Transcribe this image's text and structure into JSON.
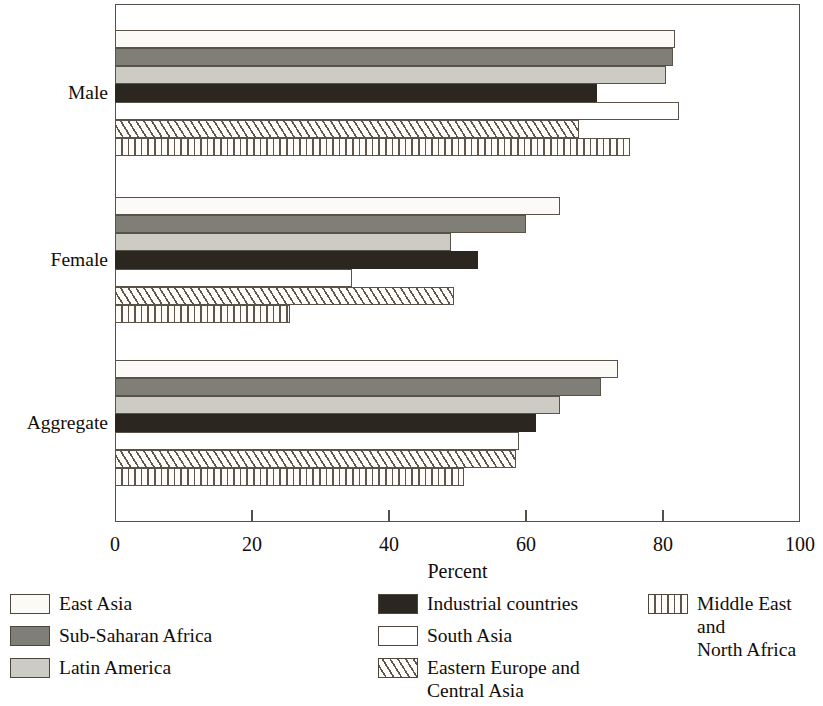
{
  "chart_data": {
    "type": "bar",
    "orientation": "horizontal",
    "title": "",
    "xlabel": "Percent",
    "ylabel": "",
    "xlim": [
      0,
      100
    ],
    "xticks": [
      0,
      20,
      40,
      60,
      80,
      100
    ],
    "xtick_labels": [
      "0",
      "20",
      "40",
      "60",
      "80",
      "100"
    ],
    "grid": false,
    "legend_position": "below",
    "categories": [
      "Male",
      "Female",
      "Aggregate"
    ],
    "series": [
      {
        "name": "East Asia",
        "values": [
          81.8,
          65.0,
          73.5
        ],
        "color": "#fbfaf6",
        "pattern": "solid"
      },
      {
        "name": "Sub-Saharan Africa",
        "values": [
          81.5,
          60.0,
          71.0
        ],
        "color": "#7f7f78",
        "pattern": "solid"
      },
      {
        "name": "Latin America",
        "values": [
          80.5,
          49.0,
          65.0
        ],
        "color": "#ccccc4",
        "pattern": "solid"
      },
      {
        "name": "Industrial countries",
        "values": [
          70.3,
          53.0,
          61.5
        ],
        "color": "#2c2620",
        "pattern": "solid"
      },
      {
        "name": "South Asia",
        "values": [
          82.3,
          34.6,
          59.0
        ],
        "color": "#ffffff",
        "pattern": "solid"
      },
      {
        "name": "Eastern Europe and Central Asia",
        "values": [
          67.8,
          49.5,
          58.5
        ],
        "color": "#fdfcf8",
        "pattern": "diagonal-hatch"
      },
      {
        "name": "Middle East and North Africa",
        "values": [
          75.2,
          25.5,
          51.0
        ],
        "color": "#fdfcf8",
        "pattern": "vertical-hatch"
      }
    ]
  },
  "axis": {
    "title": "Percent",
    "tick_labels": [
      "0",
      "20",
      "40",
      "60",
      "80",
      "100"
    ]
  },
  "group_labels": [
    "Male",
    "Female",
    "Aggregate"
  ],
  "legend": {
    "columns": [
      [
        {
          "label": "East Asia",
          "swatch": "east-asia"
        },
        {
          "label": "Sub-Saharan Africa",
          "swatch": "sub-saharan"
        },
        {
          "label": "Latin America",
          "swatch": "latin-america"
        }
      ],
      [
        {
          "label": "Industrial countries",
          "swatch": "industrial"
        },
        {
          "label": "South Asia",
          "swatch": "south-asia"
        },
        {
          "label": "Eastern Europe and\nCentral Asia",
          "swatch": "eastern-europe"
        }
      ],
      [
        {
          "label": "Middle East and\nNorth Africa",
          "swatch": "middle-east"
        }
      ]
    ]
  }
}
